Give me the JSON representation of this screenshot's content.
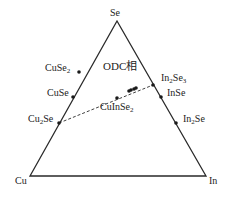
{
  "colors": {
    "line": "#2a2a2a",
    "point": "#1a1a1a",
    "text": "#222222",
    "background": "#ffffff"
  },
  "vertices": [
    {
      "id": "se",
      "label": "Se",
      "x": 117,
      "y": 21
    },
    {
      "id": "cu",
      "label": "Cu",
      "x": 30,
      "y": 176
    },
    {
      "id": "in",
      "label": "In",
      "x": 206,
      "y": 176
    }
  ],
  "phases": [
    {
      "id": "cuse2",
      "formula": "CuSe",
      "sub": "2",
      "tail": "",
      "edge": "Cu-Se",
      "x": 79,
      "y": 72,
      "lx": 45,
      "ly": 67
    },
    {
      "id": "cuse",
      "formula": "CuSe",
      "sub": "",
      "tail": "",
      "edge": "Cu-Se",
      "x": 73,
      "y": 97,
      "lx": 47,
      "ly": 92
    },
    {
      "id": "cu2se",
      "formula": "Cu",
      "sub": "2",
      "tail": "Se",
      "edge": "Cu-Se",
      "x": 59,
      "y": 123,
      "lx": 28,
      "ly": 118
    },
    {
      "id": "in2se3",
      "formula": "In",
      "sub": "2",
      "tail": "Se",
      "sub2": "3",
      "edge": "In-Se",
      "x": 153,
      "y": 85,
      "lx": 161,
      "ly": 77
    },
    {
      "id": "inse",
      "formula": "InSe",
      "sub": "",
      "tail": "",
      "edge": "In-Se",
      "x": 161,
      "y": 97,
      "lx": 167,
      "ly": 92
    },
    {
      "id": "in2se",
      "formula": "In",
      "sub": "2",
      "tail": "Se",
      "edge": "In-Se",
      "x": 176,
      "y": 123,
      "lx": 183,
      "ly": 118
    }
  ],
  "tie_line": {
    "from": "Cu2Se",
    "to": "In2Se3",
    "style": "dashed",
    "label": {
      "formula": "CuIn",
      "tail": "Se",
      "sub": "2",
      "x": 100,
      "y": 106
    },
    "points": [
      {
        "x": 117,
        "y": 98
      },
      {
        "x": 129,
        "y": 91
      },
      {
        "x": 131,
        "y": 90
      },
      {
        "x": 134,
        "y": 89
      },
      {
        "x": 136,
        "y": 88
      }
    ]
  },
  "region_label": {
    "text": "ODC相",
    "x": 103,
    "y": 65
  }
}
